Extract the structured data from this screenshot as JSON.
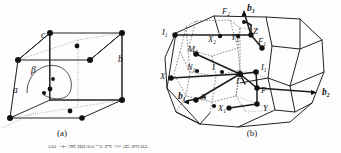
{
  "figure": {
    "panel_a": {
      "caption": "(a)",
      "description": "base-centred monoclinic unit cell",
      "labels": [
        {
          "id": "a-vector",
          "text": "a",
          "sub": "",
          "x": 13,
          "y": 93,
          "bold": false
        },
        {
          "id": "b-vector",
          "text": "b",
          "sub": "",
          "x": 118,
          "y": 62,
          "bold": false
        },
        {
          "id": "c-vector",
          "text": "c",
          "sub": "",
          "x": 41,
          "y": 38,
          "bold": false
        },
        {
          "id": "beta-angle",
          "text": "β",
          "sub": "",
          "x": 31,
          "y": 73,
          "bold": false
        }
      ]
    },
    "panel_b": {
      "caption": "(b)",
      "description": "Brillouin zone with high-symmetry points",
      "reciprocal_vectors": [
        {
          "id": "b1",
          "text": "b",
          "sub": "1",
          "x": 178,
          "y": 99
        },
        {
          "id": "b2",
          "text": "b",
          "sub": "2",
          "x": 322,
          "y": 95
        },
        {
          "id": "b3",
          "text": "b",
          "sub": "3",
          "x": 247,
          "y": 11
        }
      ],
      "symmetry_points": [
        {
          "id": "F2",
          "text": "F",
          "sub": "2",
          "x": 222,
          "y": 14
        },
        {
          "id": "Z",
          "text": "Z",
          "sub": "",
          "x": 253,
          "y": 34
        },
        {
          "id": "F1",
          "text": "F",
          "sub": "1",
          "x": 258,
          "y": 44
        },
        {
          "id": "I1",
          "text": "I",
          "sub": "1",
          "x": 164,
          "y": 35
        },
        {
          "id": "X2",
          "text": "X",
          "sub": "2",
          "x": 210,
          "y": 42
        },
        {
          "id": "Y1",
          "text": "Y",
          "sub": "1",
          "x": 233,
          "y": 40
        },
        {
          "id": "M2",
          "text": "M",
          "sub": "2",
          "x": 191,
          "y": 52
        },
        {
          "id": "N1",
          "text": "N",
          "sub": "1",
          "x": 190,
          "y": 70
        },
        {
          "id": "I",
          "text": "I",
          "sub": "",
          "x": 213,
          "y": 70
        },
        {
          "id": "L1",
          "text": "I",
          "sub": "1",
          "x": 262,
          "y": 70
        },
        {
          "id": "X",
          "text": "X",
          "sub": "",
          "x": 163,
          "y": 78
        },
        {
          "id": "Gamma",
          "text": "Γ",
          "sub": "",
          "x": 239,
          "y": 83
        },
        {
          "id": "F",
          "text": "F",
          "sub": "",
          "x": 262,
          "y": 92
        },
        {
          "id": "N",
          "text": "N",
          "sub": "",
          "x": 203,
          "y": 99
        },
        {
          "id": "X1",
          "text": "X",
          "sub": "1",
          "x": 221,
          "y": 110
        },
        {
          "id": "Y",
          "text": "Y",
          "sub": "",
          "x": 264,
          "y": 110
        }
      ]
    },
    "bottom_caption": "图  单斐晶胞与其布里渊区"
  }
}
